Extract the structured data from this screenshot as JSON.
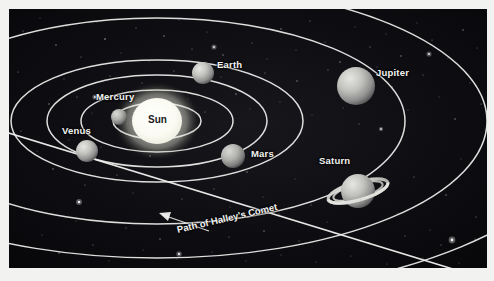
{
  "figure": {
    "background_color": "#0a0a0c",
    "border_color": "#f2f2f0",
    "orbit_color": "#f0f0ee",
    "label_color": "#f4f4f2",
    "plate": {
      "x": 9,
      "y": 9,
      "width": 478,
      "height": 259
    }
  },
  "bodies": [
    {
      "name": "sun",
      "label": "Sun",
      "label_x": 146,
      "label_y": 114,
      "cx": 157,
      "cy": 121,
      "rx": 25,
      "ry": 23,
      "color": "#fdfdf8",
      "glow": "#ffffff",
      "label_on_body": true
    },
    {
      "name": "mercury",
      "label": "Mercury",
      "label_x": 96,
      "label_y": 91,
      "cx": 118,
      "cy": 117,
      "r": 8,
      "color": "#b9b9b6"
    },
    {
      "name": "venus",
      "label": "Venus",
      "label_x": 62,
      "label_y": 125,
      "cx": 86,
      "cy": 151,
      "r": 11,
      "color": "#b4b4b1"
    },
    {
      "name": "earth",
      "label": "Earth",
      "label_x": 216,
      "label_y": 59,
      "cx": 202,
      "cy": 73,
      "r": 11,
      "color": "#bcbcb9"
    },
    {
      "name": "mars",
      "label": "Mars",
      "label_x": 250,
      "label_y": 148,
      "cx": 232,
      "cy": 156,
      "r": 12,
      "color": "#acacaa"
    },
    {
      "name": "jupiter",
      "label": "Jupiter",
      "label_x": 375,
      "label_y": 67,
      "cx": 355,
      "cy": 86,
      "r": 19,
      "color": "#b5b5b2"
    },
    {
      "name": "saturn",
      "label": "Saturn",
      "label_x": 318,
      "label_y": 155,
      "cx": 357,
      "cy": 191,
      "r": 17,
      "color": "#b2b2af",
      "has_rings": true,
      "ring_rx": 31,
      "ring_ry": 9,
      "ring_tilt_deg": -16
    }
  ],
  "annotations": [
    {
      "name": "comet-path-label",
      "text": "Path of Halley's Comet",
      "x": 176,
      "y": 229,
      "rotation_deg": -13
    }
  ],
  "orbits": [
    {
      "name": "mercury-orbit",
      "cx": 157,
      "cy": 121,
      "rx": 44,
      "ry": 18
    },
    {
      "name": "venus-orbit",
      "cx": 157,
      "cy": 121,
      "rx": 76,
      "ry": 31
    },
    {
      "name": "earth-orbit",
      "cx": 157,
      "cy": 121,
      "rx": 110,
      "ry": 46
    },
    {
      "name": "mars-orbit",
      "cx": 157,
      "cy": 121,
      "rx": 146,
      "ry": 61
    },
    {
      "name": "jupiter-orbit",
      "cx": 157,
      "cy": 121,
      "rx": 248,
      "ry": 103
    },
    {
      "name": "saturn-orbit",
      "cx": 157,
      "cy": 121,
      "rx": 330,
      "ry": 137
    },
    {
      "name": "outer-orbit-1",
      "cx": 157,
      "cy": 121,
      "rx": 430,
      "ry": 178
    },
    {
      "name": "outer-orbit-2",
      "cx": 157,
      "cy": 121,
      "rx": 520,
      "ry": 215
    }
  ],
  "comet_path": {
    "name": "halleys-comet-path",
    "description": "Long straight inclined path crossing the ecliptic plane"
  },
  "stars_count": 220
}
